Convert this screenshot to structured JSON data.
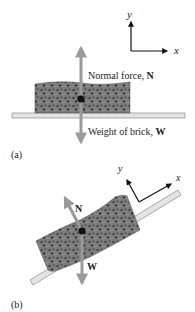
{
  "panel_a": {
    "caption": "(a)",
    "axes": {
      "x_label": "x",
      "y_label": "y"
    },
    "normal_force_label": "Normal force, ",
    "normal_force_symbol": "N",
    "weight_label": "Weight of brick, ",
    "weight_symbol": "W"
  },
  "panel_b": {
    "caption": "(b)",
    "axes": {
      "x_label": "x",
      "y_label": "y"
    },
    "normal_force_symbol": "N",
    "weight_symbol": "W"
  },
  "colors": {
    "arrow": "#9a9a9a",
    "plank_fill": "#e4e4e4",
    "plank_stroke": "#8a8a8a",
    "brick": "#6e6e6e",
    "axes": "#111111"
  }
}
